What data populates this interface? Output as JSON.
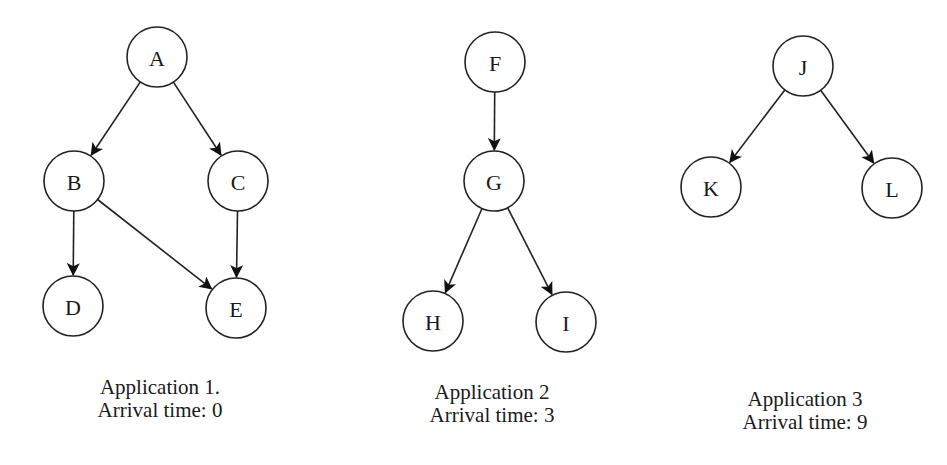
{
  "applications": [
    {
      "title": "Application 1.",
      "arrival": "Arrival time: 0",
      "nodes": [
        {
          "id": "A",
          "x": 157,
          "y": 57
        },
        {
          "id": "B",
          "x": 74,
          "y": 181
        },
        {
          "id": "C",
          "x": 238,
          "y": 181
        },
        {
          "id": "D",
          "x": 73,
          "y": 306
        },
        {
          "id": "E",
          "x": 236,
          "y": 308
        }
      ],
      "edges": [
        [
          "A",
          "B"
        ],
        [
          "A",
          "C"
        ],
        [
          "B",
          "D"
        ],
        [
          "B",
          "E"
        ],
        [
          "C",
          "E"
        ]
      ]
    },
    {
      "title": "Application 2",
      "arrival": "Arrival time: 3",
      "nodes": [
        {
          "id": "F",
          "x": 495,
          "y": 62
        },
        {
          "id": "G",
          "x": 494,
          "y": 181
        },
        {
          "id": "H",
          "x": 433,
          "y": 321
        },
        {
          "id": "I",
          "x": 566,
          "y": 322
        }
      ],
      "edges": [
        [
          "F",
          "G"
        ],
        [
          "G",
          "H"
        ],
        [
          "G",
          "I"
        ]
      ]
    },
    {
      "title": "Application 3",
      "arrival": "Arrival time: 9",
      "nodes": [
        {
          "id": "J",
          "x": 803,
          "y": 66
        },
        {
          "id": "K",
          "x": 711,
          "y": 187
        },
        {
          "id": "L",
          "x": 892,
          "y": 188
        }
      ],
      "edges": [
        [
          "J",
          "K"
        ],
        [
          "J",
          "L"
        ]
      ]
    }
  ],
  "style": {
    "node_radius": 30,
    "stroke_color": "#222222",
    "background": "#ffffff"
  }
}
